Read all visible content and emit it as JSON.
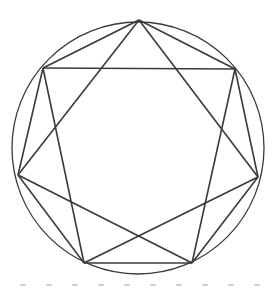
{
  "diagram": {
    "type": "inscribed-heptagon-with-heptagram",
    "stroke_color": "#3a3a3a",
    "background": "#ffffff",
    "circle": {
      "cx": 138,
      "cy": 148,
      "r": 126
    },
    "vertices": [
      {
        "name": "top",
        "x": 139,
        "y": 20
      },
      {
        "name": "upper-right",
        "x": 235,
        "y": 69
      },
      {
        "name": "right",
        "x": 258,
        "y": 177
      },
      {
        "name": "bottom-right",
        "x": 192,
        "y": 263
      },
      {
        "name": "bottom-left",
        "x": 84,
        "y": 263
      },
      {
        "name": "left",
        "x": 18,
        "y": 175
      },
      {
        "name": "upper-left",
        "x": 43,
        "y": 68
      }
    ],
    "heptagon_edges": [
      [
        0,
        1
      ],
      [
        1,
        2
      ],
      [
        2,
        3
      ],
      [
        3,
        4
      ],
      [
        4,
        5
      ],
      [
        5,
        6
      ],
      [
        6,
        0
      ]
    ],
    "heptagram_edges": [
      [
        0,
        3
      ],
      [
        3,
        5
      ],
      [
        5,
        1
      ],
      [
        1,
        4
      ],
      [
        4,
        6
      ],
      [
        6,
        1
      ]
    ],
    "star_edges_full": [
      [
        0,
        2
      ],
      [
        2,
        4
      ],
      [
        4,
        6
      ],
      [
        6,
        1
      ],
      [
        1,
        3
      ],
      [
        3,
        5
      ],
      [
        5,
        0
      ]
    ]
  }
}
